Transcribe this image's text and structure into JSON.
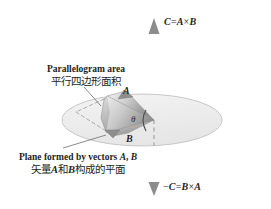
{
  "figure": {
    "background_color": "#ffffff",
    "ink_color": "#231f20"
  },
  "labels": {
    "top_vector": {
      "text": "C = A × B",
      "parts": {
        "lhs": "C",
        "eq": "=",
        "a": "A",
        "times": "×",
        "b": "B"
      }
    },
    "bottom_vector": {
      "text": "− C = B × A",
      "parts": {
        "minus": "−",
        "lhs": "C",
        "eq": "=",
        "b": "B",
        "times": "×",
        "a": "A"
      }
    },
    "parallelogram_callout": {
      "english": "Parallelogram area",
      "chinese": "平行四边形面积"
    },
    "plane_callout": {
      "english_prefix": "Plane formed by vectors ",
      "english_vec_a": "A",
      "english_comma": ", ",
      "english_vec_b": "B",
      "chinese_prefix": "矢量",
      "chinese_vec_a": "A",
      "chinese_mid": "和",
      "chinese_vec_b": "B",
      "chinese_suffix": "构成的平面"
    },
    "vector_a": "A",
    "vector_b": "B",
    "angle": "θ"
  },
  "geometry": {
    "plane_ellipse": {
      "cx": 142,
      "cy": 120,
      "rx": 80,
      "ry": 26,
      "fill": "#eeeeee",
      "stroke": "#bfbfbf"
    },
    "axis": {
      "x": 154,
      "top_y": 18,
      "bottom_y": 196,
      "color": "#8a8a8a"
    },
    "parallelogram_fill_light": "#e9e9e9",
    "parallelogram_fill_dark": "#9a9a9a",
    "dashed_stroke": "#a9a9a9"
  }
}
